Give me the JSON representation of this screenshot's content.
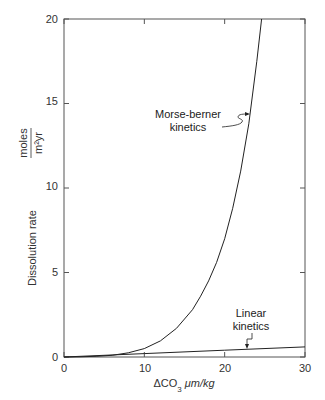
{
  "chart_data": {
    "type": "line",
    "title": "",
    "xlabel": "ΔCO3 μm/kg",
    "xlabel_main": "ΔCO",
    "xlabel_sub": "3",
    "xlabel_unit": " μm/kg",
    "ylabel": "Dissolution rate (moles / m²yr)",
    "ylabel_main": "Dissolution rate",
    "ylabel_unit_num": "moles",
    "ylabel_unit_den": "m²yr",
    "xlim": [
      0,
      30
    ],
    "ylim": [
      0,
      20
    ],
    "xticks": [
      "0",
      "10",
      "20",
      "30"
    ],
    "yticks": [
      "0",
      "5",
      "10",
      "15",
      "20"
    ],
    "grid": false,
    "legend": "none (inline annotations)",
    "series": [
      {
        "name": "Morse-berner kinetics",
        "x": [
          0,
          2,
          4,
          6,
          8,
          10,
          12,
          14,
          16,
          17,
          18,
          19,
          20,
          21,
          22,
          23,
          24,
          24.6
        ],
        "y": [
          0,
          0.01,
          0.04,
          0.1,
          0.25,
          0.5,
          0.95,
          1.7,
          2.8,
          3.6,
          4.5,
          5.6,
          7.0,
          8.8,
          11.0,
          13.8,
          17.5,
          20
        ]
      },
      {
        "name": "Linear kinetics",
        "x": [
          0,
          10,
          20,
          30
        ],
        "y": [
          0,
          0.2,
          0.4,
          0.6
        ]
      }
    ],
    "annotations": [
      {
        "text_line1": "Morse-berner",
        "text_line2": "kinetics",
        "points_to": "Morse-berner kinetics curve near x≈23, y≈14"
      },
      {
        "text_line1": "Linear",
        "text_line2": "kinetics",
        "points_to": "Linear kinetics line near x≈23, y≈0.45"
      }
    ]
  }
}
